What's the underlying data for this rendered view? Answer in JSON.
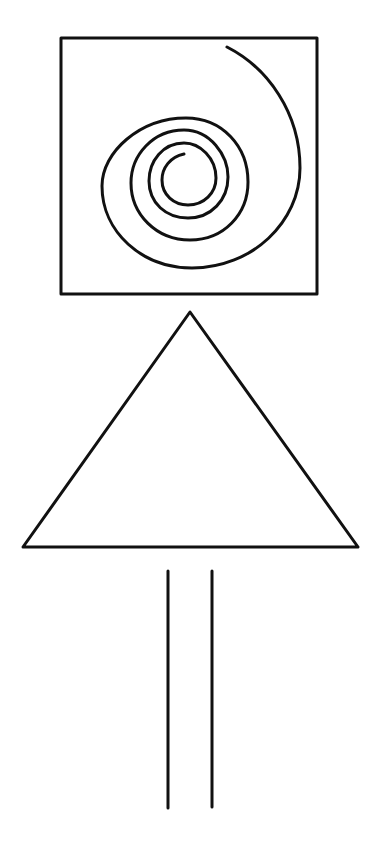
{
  "figure": {
    "stroke_color": "#111111",
    "background_color": "#ffffff",
    "shapes": [
      {
        "name": "square-with-spiral",
        "type": "square",
        "contains": "spiral"
      },
      {
        "name": "triangle",
        "type": "triangle"
      },
      {
        "name": "parallel-lines",
        "type": "two-vertical-lines"
      }
    ]
  }
}
